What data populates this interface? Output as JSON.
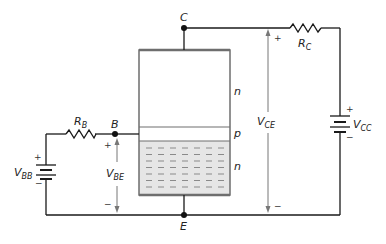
{
  "diagram": {
    "type": "circuit",
    "nodes": {
      "collector": "C",
      "base": "B",
      "emitter": "E"
    },
    "regions": [
      {
        "label": "n",
        "role": "collector region"
      },
      {
        "label": "p",
        "role": "base region"
      },
      {
        "label": "n",
        "role": "emitter region"
      }
    ],
    "components": {
      "rb": {
        "main": "R",
        "sub": "B"
      },
      "rc": {
        "main": "R",
        "sub": "C"
      },
      "vbb": {
        "main": "V",
        "sub": "BB",
        "plus": "+",
        "minus": "−"
      },
      "vcc": {
        "main": "V",
        "sub": "CC",
        "plus": "+",
        "minus": "−"
      }
    },
    "voltages": {
      "vbe": {
        "main": "V",
        "sub": "BE",
        "plus": "+",
        "minus": "−"
      },
      "vce": {
        "main": "V",
        "sub": "CE",
        "plus": "+",
        "minus": "−"
      }
    },
    "colors": {
      "wire": "#1a1a1a",
      "box_border": "#6e6e6e",
      "emitter_fill": "#e6e6e6",
      "dash": "#8a8a8a",
      "arrow": "#777777"
    }
  }
}
